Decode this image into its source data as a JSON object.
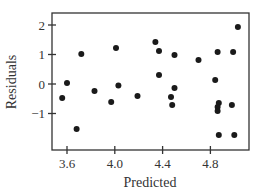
{
  "chart_data": {
    "type": "scatter",
    "title": "",
    "xlabel": "Predicted",
    "ylabel": "Residuals",
    "xlim": [
      3.48,
      5.08
    ],
    "ylim": [
      -2.3,
      2.4
    ],
    "x_ticks": [
      3.6,
      4.0,
      4.4,
      4.8
    ],
    "x_tick_labels": [
      "3.6",
      "4.0",
      "4.4",
      "4.8"
    ],
    "y_ticks": [
      -1,
      0,
      1,
      2
    ],
    "y_tick_labels": [
      "−1",
      "0",
      "1",
      "2"
    ],
    "grid": false,
    "legend": null,
    "marker_color": "#1a1a1a",
    "points": [
      {
        "x": 3.56,
        "y": -0.47
      },
      {
        "x": 3.6,
        "y": 0.03
      },
      {
        "x": 3.68,
        "y": -1.53
      },
      {
        "x": 3.72,
        "y": 1.02
      },
      {
        "x": 3.83,
        "y": -0.24
      },
      {
        "x": 3.97,
        "y": -0.61
      },
      {
        "x": 4.01,
        "y": 1.22
      },
      {
        "x": 4.03,
        "y": -0.05
      },
      {
        "x": 4.19,
        "y": -0.41
      },
      {
        "x": 4.34,
        "y": 1.42
      },
      {
        "x": 4.37,
        "y": 1.12
      },
      {
        "x": 4.5,
        "y": 0.98
      },
      {
        "x": 4.37,
        "y": 0.31
      },
      {
        "x": 4.5,
        "y": -0.14
      },
      {
        "x": 4.47,
        "y": -0.44
      },
      {
        "x": 4.48,
        "y": -0.71
      },
      {
        "x": 4.7,
        "y": 0.81
      },
      {
        "x": 4.84,
        "y": 0.14
      },
      {
        "x": 4.86,
        "y": 1.08
      },
      {
        "x": 4.99,
        "y": 1.08
      },
      {
        "x": 5.03,
        "y": 1.93
      },
      {
        "x": 4.87,
        "y": -0.64
      },
      {
        "x": 4.86,
        "y": -0.78
      },
      {
        "x": 4.86,
        "y": -0.92
      },
      {
        "x": 4.98,
        "y": -0.71
      },
      {
        "x": 4.87,
        "y": -1.73
      },
      {
        "x": 5.0,
        "y": -1.73
      }
    ]
  }
}
